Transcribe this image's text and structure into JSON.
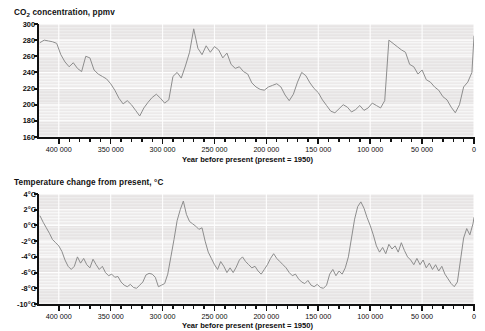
{
  "figure": {
    "background": "#ffffff",
    "plot_background": "#eceaea",
    "line_color": "#8d8d8d",
    "axis_color": "#111111"
  },
  "panels": {
    "co2": {
      "title_prefix": "CO",
      "title_sub": "2",
      "title_suffix": " concentration, ppmv",
      "title_full": "CO2 concentration, ppmv",
      "xlabel": "Year before present (present = 1950)",
      "yticks": [
        "300",
        "280",
        "260",
        "240",
        "220",
        "200",
        "180",
        "160"
      ],
      "xticks": [
        "400 000",
        "350 000",
        "300 000",
        "250 000",
        "200 000",
        "150 000",
        "100 000",
        "50 000",
        "0"
      ]
    },
    "temperature": {
      "title_full": "Temperature change from present, °C",
      "xlabel": "Year before present (present = 1950)",
      "yticks": [
        "4°C",
        "2°C",
        "0°C",
        "-2°C",
        "-4°C",
        "-6°C",
        "-8°C",
        "-10°C"
      ],
      "xticks": [
        "400 000",
        "350 000",
        "300 000",
        "250 000",
        "200 000",
        "150 000",
        "100 000",
        "50 000",
        "0"
      ]
    }
  },
  "chart_data": [
    {
      "type": "line",
      "id": "co2",
      "title": "CO2 concentration, ppmv",
      "xlabel": "Year before present (present = 1950)",
      "ylabel": "CO2 concentration, ppmv",
      "xlim": [
        420000,
        0
      ],
      "ylim": [
        160,
        300
      ],
      "x_reversed": true,
      "ytick_values": [
        300,
        280,
        260,
        240,
        220,
        200,
        180,
        160
      ],
      "ytick_labels": [
        "300",
        "280",
        "260",
        "240",
        "220",
        "200",
        "180",
        "160"
      ],
      "xtick_values": [
        400000,
        350000,
        300000,
        250000,
        200000,
        150000,
        100000,
        50000,
        0
      ],
      "xtick_labels": [
        "400 000",
        "350 000",
        "300 000",
        "250 000",
        "200 000",
        "150 000",
        "100 000",
        "50 000",
        "0"
      ],
      "minor_xticks_per_interval": 5,
      "grid": "horizontal-bands-and-faint-vertical",
      "legend": null,
      "x": [
        418000,
        414000,
        410000,
        406000,
        402000,
        398000,
        394000,
        390000,
        386000,
        382000,
        378000,
        374000,
        370000,
        366000,
        362000,
        358000,
        354000,
        350000,
        346000,
        342000,
        338000,
        334000,
        330000,
        326000,
        322000,
        318000,
        314000,
        310000,
        306000,
        302000,
        298000,
        294000,
        290000,
        286000,
        282000,
        278000,
        274000,
        270000,
        266000,
        262000,
        258000,
        254000,
        250000,
        246000,
        242000,
        238000,
        234000,
        230000,
        226000,
        222000,
        218000,
        214000,
        210000,
        206000,
        202000,
        198000,
        194000,
        190000,
        186000,
        182000,
        178000,
        174000,
        170000,
        166000,
        162000,
        158000,
        154000,
        150000,
        146000,
        142000,
        138000,
        134000,
        130000,
        126000,
        122000,
        118000,
        114000,
        110000,
        106000,
        102000,
        98000,
        94000,
        90000,
        86000,
        82000,
        78000,
        74000,
        70000,
        66000,
        62000,
        58000,
        54000,
        50000,
        46000,
        42000,
        38000,
        34000,
        30000,
        26000,
        22000,
        18000,
        14000,
        10000,
        6000,
        2000,
        0
      ],
      "y": [
        277,
        280,
        279,
        278,
        276,
        262,
        253,
        247,
        252,
        245,
        241,
        260,
        258,
        243,
        238,
        235,
        232,
        226,
        218,
        208,
        201,
        205,
        200,
        193,
        186,
        196,
        203,
        209,
        213,
        208,
        202,
        206,
        235,
        240,
        233,
        248,
        265,
        294,
        270,
        262,
        273,
        265,
        272,
        268,
        258,
        264,
        250,
        245,
        247,
        241,
        238,
        227,
        222,
        219,
        218,
        222,
        224,
        226,
        222,
        212,
        205,
        213,
        228,
        240,
        236,
        227,
        220,
        215,
        206,
        199,
        192,
        190,
        195,
        200,
        197,
        191,
        194,
        199,
        193,
        196,
        202,
        199,
        196,
        205,
        280,
        276,
        272,
        268,
        265,
        250,
        247,
        238,
        243,
        231,
        228,
        222,
        218,
        210,
        206,
        197,
        190,
        200,
        222,
        228,
        240,
        285
      ],
      "annotations": [],
      "notes": "Vostok ice core CO2 record; glacial minima near 180-190 ppmv, interglacial peaks near 280-300 ppmv, sharp rise at present."
    },
    {
      "type": "line",
      "id": "temperature",
      "title": "Temperature change from present, °C",
      "xlabel": "Year before present (present = 1950)",
      "ylabel": "Temperature change from present, °C",
      "xlim": [
        420000,
        0
      ],
      "ylim": [
        -10,
        4
      ],
      "x_reversed": true,
      "ytick_values": [
        4,
        2,
        0,
        -2,
        -4,
        -6,
        -8,
        -10
      ],
      "ytick_labels": [
        "4°C",
        "2°C",
        "0°C",
        "-2°C",
        "-4°C",
        "-6°C",
        "-8°C",
        "-10°C"
      ],
      "xtick_values": [
        400000,
        350000,
        300000,
        250000,
        200000,
        150000,
        100000,
        50000,
        0
      ],
      "xtick_labels": [
        "400 000",
        "350 000",
        "300 000",
        "250 000",
        "200 000",
        "150 000",
        "100 000",
        "50 000",
        "0"
      ],
      "minor_xticks_per_interval": 5,
      "grid": "horizontal-bands-and-faint-vertical",
      "legend": null,
      "x": [
        418000,
        415000,
        412000,
        409000,
        406000,
        403000,
        400000,
        397000,
        394000,
        391000,
        388000,
        385000,
        382000,
        379000,
        376000,
        373000,
        370000,
        367000,
        364000,
        361000,
        358000,
        355000,
        352000,
        349000,
        346000,
        343000,
        340000,
        337000,
        334000,
        331000,
        328000,
        325000,
        322000,
        319000,
        316000,
        313000,
        310000,
        307000,
        304000,
        301000,
        298000,
        295000,
        292000,
        289000,
        286000,
        283000,
        280000,
        277000,
        274000,
        271000,
        268000,
        265000,
        262000,
        259000,
        256000,
        253000,
        250000,
        247000,
        244000,
        241000,
        238000,
        235000,
        232000,
        229000,
        226000,
        223000,
        220000,
        217000,
        214000,
        211000,
        208000,
        205000,
        202000,
        199000,
        196000,
        193000,
        190000,
        187000,
        184000,
        181000,
        178000,
        175000,
        172000,
        169000,
        166000,
        163000,
        160000,
        157000,
        154000,
        151000,
        148000,
        145000,
        142000,
        139000,
        136000,
        133000,
        130000,
        127000,
        124000,
        121000,
        118000,
        115000,
        112000,
        109000,
        106000,
        103000,
        100000,
        97000,
        94000,
        91000,
        88000,
        85000,
        82000,
        79000,
        76000,
        73000,
        70000,
        67000,
        64000,
        61000,
        58000,
        55000,
        52000,
        49000,
        46000,
        43000,
        40000,
        37000,
        34000,
        31000,
        28000,
        25000,
        22000,
        19000,
        16000,
        13000,
        10000,
        7000,
        4000,
        1000,
        0
      ],
      "y": [
        1.2,
        0.4,
        -0.3,
        -1.0,
        -1.8,
        -2.2,
        -2.6,
        -3.3,
        -4.4,
        -5.2,
        -5.6,
        -5.2,
        -4.0,
        -4.8,
        -4.2,
        -5.0,
        -5.4,
        -4.3,
        -5.0,
        -5.6,
        -5.2,
        -6.0,
        -6.4,
        -6.2,
        -6.6,
        -6.5,
        -7.2,
        -7.6,
        -7.8,
        -7.5,
        -7.9,
        -8.0,
        -7.6,
        -7.2,
        -6.3,
        -6.1,
        -6.2,
        -6.6,
        -7.8,
        -7.6,
        -7.4,
        -6.2,
        -4.0,
        -1.8,
        0.6,
        2.0,
        3.1,
        1.4,
        0.5,
        0.2,
        -0.1,
        -0.5,
        -0.3,
        -2.0,
        -3.4,
        -4.2,
        -5.0,
        -5.6,
        -4.6,
        -5.2,
        -6.0,
        -5.4,
        -6.0,
        -5.3,
        -4.4,
        -4.0,
        -4.6,
        -5.0,
        -5.4,
        -5.2,
        -5.8,
        -6.2,
        -5.6,
        -5.0,
        -4.2,
        -3.6,
        -4.2,
        -4.6,
        -5.0,
        -5.4,
        -6.0,
        -6.4,
        -6.2,
        -6.8,
        -7.2,
        -7.4,
        -7.0,
        -7.6,
        -7.8,
        -7.5,
        -7.9,
        -8.0,
        -7.6,
        -6.2,
        -5.6,
        -6.4,
        -5.8,
        -6.2,
        -5.4,
        -4.0,
        -1.6,
        0.8,
        2.4,
        3.0,
        2.2,
        1.0,
        0.0,
        -1.2,
        -2.6,
        -3.4,
        -2.8,
        -3.6,
        -2.4,
        -3.0,
        -2.6,
        -3.4,
        -2.2,
        -3.2,
        -4.0,
        -4.4,
        -5.0,
        -4.2,
        -5.0,
        -4.4,
        -5.4,
        -4.8,
        -5.6,
        -5.0,
        -5.8,
        -5.2,
        -6.2,
        -6.8,
        -7.4,
        -7.8,
        -7.2,
        -4.4,
        -1.6,
        -0.4,
        -1.2,
        0.2,
        1.0
      ],
      "annotations": [],
      "notes": "Vostok ice core temperature anomaly record; glacial minima near -8°C, interglacial peaks near +3°C."
    }
  ]
}
